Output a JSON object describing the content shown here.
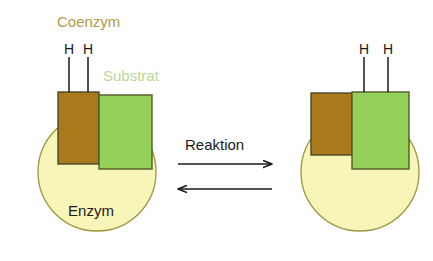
{
  "figure": {
    "background_color": "#ffffff"
  },
  "colors": {
    "coenzyme_fill": "#a9791c",
    "coenzyme_stroke": "#4a4a28",
    "coenzyme_label": "#b09a4a",
    "substrate_fill": "#93d057",
    "substrate_stroke": "#4f5a28",
    "substrate_label": "#b7dc9a",
    "enzyme_fill": "#f8f5b8",
    "enzyme_stroke": "#9a9640",
    "text_dark": "#1a1a1a",
    "line_dark": "#1a1a1a",
    "arrow_color": "#1a1a1a"
  },
  "labels": {
    "coenzyme": "Coenzym",
    "substrate": "Substrat",
    "enzyme": "Enzym",
    "reaction": "Reaktion",
    "hydrogen": "H"
  },
  "left_complex": {
    "name": "Ausgangszustand",
    "enzyme_label": "Enzym",
    "coenzyme_label": "Coenzym",
    "substrate_label": "Substrat",
    "hydrogens": [
      "H",
      "H"
    ],
    "hydrogen_attached_to": "Coenzym"
  },
  "right_complex": {
    "name": "Endzustand",
    "hydrogens": [
      "H",
      "H"
    ],
    "hydrogen_attached_to": "Substrat"
  },
  "reaction": {
    "label": "Reaktion",
    "forward_direction": "rechts",
    "reverse_direction": "links",
    "reversible": "ja"
  }
}
